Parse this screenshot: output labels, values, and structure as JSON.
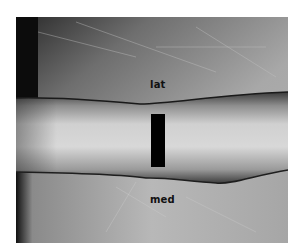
{
  "image": {
    "description": "Grayscale clinical photograph of a forearm lying on a white sheet, with orientation labels and a black redaction bar",
    "labels": {
      "top": "lat",
      "bottom": "med"
    },
    "colors": {
      "background": "#ffffff",
      "redaction": "#000000",
      "label_text": "#111111"
    }
  }
}
